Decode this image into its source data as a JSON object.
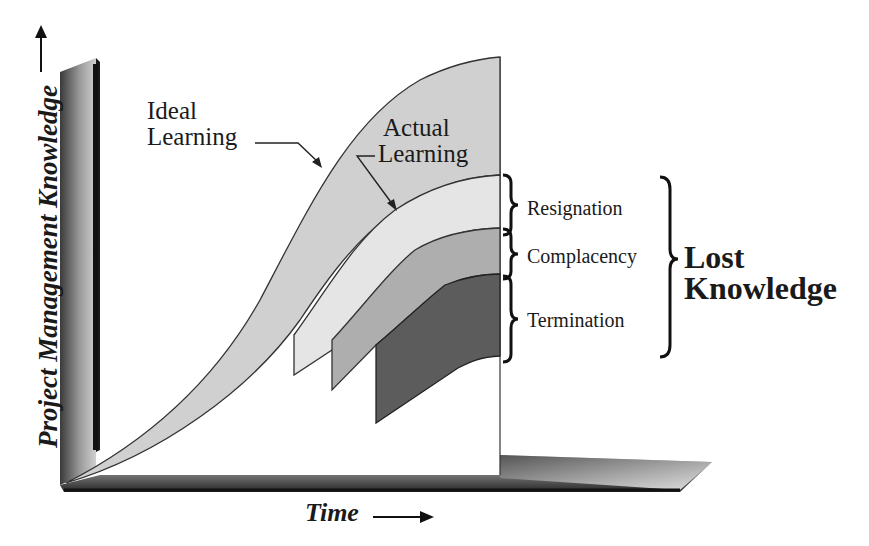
{
  "diagram": {
    "title": "",
    "y_axis": {
      "label": "Project Management Knowledge",
      "arrow": "up-arrow"
    },
    "x_axis": {
      "label": "Time",
      "arrow": "right-arrow"
    },
    "curves": [
      {
        "id": "ideal",
        "label_line1": "Ideal",
        "label_line2": "Learning",
        "fill": "#d2d2d2"
      },
      {
        "id": "actual",
        "label_line1": "Actual",
        "label_line2": "Learning",
        "fill": "#e4e4e4"
      },
      {
        "id": "complacency-band",
        "fill": "#b0b0b0"
      },
      {
        "id": "termination-band",
        "fill": "#5e5e5e"
      }
    ],
    "losses": [
      {
        "label": "Resignation",
        "brace": "brace-icon"
      },
      {
        "label": "Complacency",
        "brace": "brace-icon"
      },
      {
        "label": "Termination",
        "brace": "brace-icon"
      }
    ],
    "summary": {
      "line1": "Lost",
      "line2": "Knowledge",
      "brace": "big-brace-icon"
    }
  }
}
